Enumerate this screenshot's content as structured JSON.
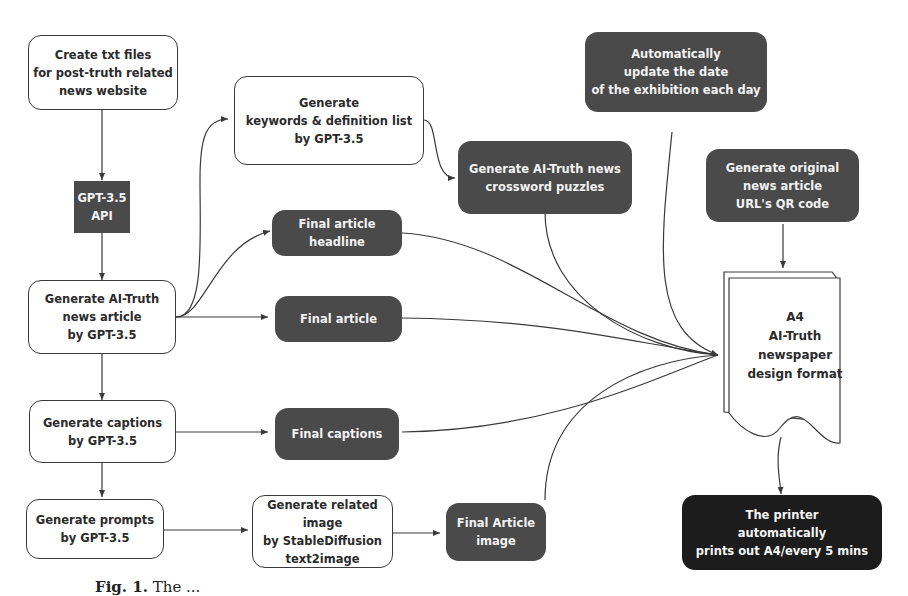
{
  "diagram": {
    "nodes": {
      "create_txt": {
        "label": "Create txt files\nfor post-truth related\nnews website"
      },
      "gpt_api": {
        "label": "GPT-3.5\nAPI"
      },
      "gen_article": {
        "label": "Generate AI-Truth\nnews article\nby GPT-3.5"
      },
      "gen_captions": {
        "label": "Generate captions\nby GPT-3.5"
      },
      "gen_prompts": {
        "label": "Generate prompts\nby GPT-3.5"
      },
      "gen_keywords": {
        "label": "Generate\nkeywords & definition list\nby GPT-3.5"
      },
      "final_headline": {
        "label": "Final article\nheadline"
      },
      "final_article": {
        "label": "Final article"
      },
      "final_captions": {
        "label": "Final captions"
      },
      "gen_image": {
        "label": "Generate related image\nby StableDiffusion\ntext2image"
      },
      "final_image": {
        "label": "Final Article\nimage"
      },
      "crossword": {
        "label": "Generate AI-Truth news\ncrossword puzzles"
      },
      "update_date": {
        "label": "Automatically\nupdate the date\nof the exhibition each day"
      },
      "qr_code": {
        "label": "Generate original\nnews article\nURL's QR code"
      },
      "a4_format": {
        "label": "A4\nAI-Truth\nnewspaper\ndesign format"
      },
      "printer": {
        "label": "The printer\nautomatically\nprints out A4/every 5 mins"
      }
    },
    "edges": [
      [
        "create_txt",
        "gpt_api"
      ],
      [
        "gpt_api",
        "gen_article"
      ],
      [
        "gen_article",
        "gen_keywords"
      ],
      [
        "gen_article",
        "final_headline"
      ],
      [
        "gen_article",
        "final_article"
      ],
      [
        "gen_article",
        "gen_captions"
      ],
      [
        "gen_captions",
        "final_captions"
      ],
      [
        "gen_captions",
        "gen_prompts"
      ],
      [
        "gen_prompts",
        "gen_image"
      ],
      [
        "gen_image",
        "final_image"
      ],
      [
        "gen_keywords",
        "crossword"
      ],
      [
        "final_headline",
        "a4_format"
      ],
      [
        "final_article",
        "a4_format"
      ],
      [
        "final_captions",
        "a4_format"
      ],
      [
        "final_image",
        "a4_format"
      ],
      [
        "crossword",
        "a4_format"
      ],
      [
        "update_date",
        "a4_format"
      ],
      [
        "qr_code",
        "a4_format"
      ],
      [
        "a4_format",
        "printer"
      ]
    ],
    "colors": {
      "dark_node": "#4a4a4a",
      "printer_node": "#1c1c1c",
      "line": "#3a3a3a"
    }
  },
  "caption": {
    "prefix": "Fig. 1.",
    "text": "The ..."
  }
}
